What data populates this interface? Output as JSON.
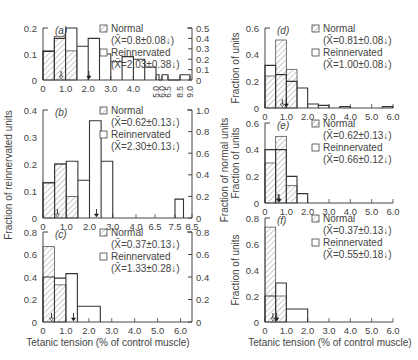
{
  "chart_data": [
    {
      "panel": "a",
      "type": "bar",
      "title": "(a)",
      "xlabel": "",
      "ylabel_left": "Fraction of reinnervated units",
      "ylabel_right": "Fraction of normal units",
      "x_ticks": [
        "0",
        "1.0",
        "2.0",
        "3.0",
        "4.0",
        "5.0",
        "6.0",
        "6.5",
        "8.5",
        "9.0"
      ],
      "y_left_ticks": [
        "0",
        "0.1",
        "0.2"
      ],
      "y_left_lim": [
        0,
        0.2
      ],
      "y_right_ticks": [
        "0",
        "0.1",
        "0.2",
        "0.3",
        "0.4",
        "0.5"
      ],
      "y_right_lim": [
        0,
        0.5
      ],
      "legend": [
        {
          "label": "Normal",
          "stat": "(X̄=0.8±0.08↓)",
          "style": "hatched"
        },
        {
          "label": "Reinnervated",
          "stat": "(X̄=2.03±0.38↓)",
          "style": "open"
        }
      ],
      "series": [
        {
          "name": "Normal (right axis)",
          "bins": [
            [
              0,
              0.5,
              0.28
            ],
            [
              0.5,
              1.0,
              0.42
            ],
            [
              1.0,
              1.5,
              0.28
            ]
          ]
        },
        {
          "name": "Reinnervated (left axis)",
          "bins": [
            [
              0,
              0.5,
              0.11
            ],
            [
              0.5,
              1.0,
              0.16
            ],
            [
              1.0,
              1.5,
              0.2
            ],
            [
              1.5,
              2.0,
              0.13
            ],
            [
              2.0,
              2.5,
              0.16
            ],
            [
              2.5,
              3.0,
              0.1
            ],
            [
              3.0,
              3.5,
              0.07
            ],
            [
              3.5,
              4.0,
              0.09
            ],
            [
              4.0,
              4.5,
              0.08
            ],
            [
              4.5,
              5.0,
              0.05
            ],
            [
              5.0,
              5.5,
              0.02
            ],
            [
              5.5,
              6.0,
              0.0
            ],
            [
              6.0,
              6.5,
              0.02
            ],
            [
              6.5,
              8.5,
              0.0
            ],
            [
              8.5,
              9.0,
              0.02
            ]
          ]
        }
      ],
      "mean_arrows": {
        "normal": 0.8,
        "reinnervated": 2.03
      }
    },
    {
      "panel": "b",
      "type": "bar",
      "title": "(b)",
      "x_ticks": [
        "0",
        "1.0",
        "2.0",
        "3.0",
        "4.0",
        "6.5",
        "7.5",
        "8.5"
      ],
      "y_left_ticks": [
        "0",
        "0.1",
        "0.2",
        "0.3",
        "0.4"
      ],
      "y_left_lim": [
        0,
        0.4
      ],
      "y_right_ticks": [
        "0",
        "0.2",
        "0.4",
        "0.6",
        "0.8",
        "1.0"
      ],
      "y_right_lim": [
        0,
        1.0
      ],
      "legend": [
        {
          "label": "Normal",
          "stat": "(X̄=0.62±0.13↓)",
          "style": "hatched"
        },
        {
          "label": "Reinnervated",
          "stat": "(X̄=2.30±0.13↓)",
          "style": "open"
        }
      ],
      "series": [
        {
          "name": "Normal (right axis)",
          "bins": [
            [
              0,
              0.5,
              0.33
            ],
            [
              0.5,
              1.0,
              0.5
            ],
            [
              1.0,
              1.5,
              0.2
            ]
          ]
        },
        {
          "name": "Reinnervated (left axis)",
          "bins": [
            [
              0,
              0.5,
              0.13
            ],
            [
              0.5,
              1.0,
              0.2
            ],
            [
              1.0,
              1.5,
              0.21
            ],
            [
              1.5,
              2.0,
              0.14
            ],
            [
              2.0,
              2.5,
              0.36
            ],
            [
              2.5,
              3.0,
              0.21
            ],
            [
              7.5,
              8.0,
              0.07
            ]
          ]
        }
      ],
      "mean_arrows": {
        "normal": 0.62,
        "reinnervated": 2.3
      }
    },
    {
      "panel": "c",
      "type": "bar",
      "title": "(c)",
      "xlabel": "Tetanic tension (% of control muscle)",
      "x_ticks": [
        "0",
        "1.0",
        "2.0",
        "3.0",
        "4.0",
        "5.0",
        "6.0"
      ],
      "y_left_ticks": [
        "0",
        "0.2",
        "0.4",
        "0.6",
        "0.8"
      ],
      "y_left_lim": [
        0,
        0.8
      ],
      "y_right_ticks": [
        "0",
        "0.2",
        "0.4",
        "0.6",
        "0.8"
      ],
      "y_right_lim": [
        0,
        0.8
      ],
      "legend": [
        {
          "label": "Normal",
          "stat": "(X̄=0.37±0.13↓)",
          "style": "hatched"
        },
        {
          "label": "Reinnervated",
          "stat": "(X̄=1.33±0.28↓)",
          "style": "open"
        }
      ],
      "series": [
        {
          "name": "Normal",
          "bins": [
            [
              0,
              0.5,
              0.67
            ],
            [
              0.5,
              1.0,
              0.33
            ]
          ]
        },
        {
          "name": "Reinnervated",
          "bins": [
            [
              0,
              0.5,
              0.4
            ],
            [
              0.5,
              1.0,
              0.39
            ],
            [
              1.0,
              1.5,
              0.43
            ],
            [
              1.5,
              2.5,
              0.14
            ]
          ]
        }
      ],
      "mean_arrows": {
        "normal": 0.37,
        "reinnervated": 1.33
      }
    },
    {
      "panel": "d",
      "type": "bar",
      "title": "(d)",
      "ylabel": "Fraction of units",
      "x_ticks": [
        "0",
        "1.0",
        "2.0",
        "3.0",
        "4.0",
        "5.0",
        "6.0"
      ],
      "y_ticks": [
        "0",
        "0.2",
        "0.4",
        "0.6"
      ],
      "ylim": [
        0,
        0.6
      ],
      "legend": [
        {
          "label": "Normal",
          "stat": "(X̄=0.81±0.08↓)",
          "style": "hatched"
        },
        {
          "label": "Reinnervated",
          "stat": "(X̄=1.00±0.08↓)",
          "style": "open"
        }
      ],
      "series": [
        {
          "name": "Normal",
          "bins": [
            [
              0,
              0.5,
              0.24
            ],
            [
              0.5,
              1.0,
              0.51
            ],
            [
              1.0,
              1.5,
              0.29
            ]
          ]
        },
        {
          "name": "Reinnervated",
          "bins": [
            [
              0,
              0.5,
              0.32
            ],
            [
              0.5,
              1.0,
              0.25
            ],
            [
              1.0,
              1.5,
              0.2
            ],
            [
              1.5,
              2.0,
              0.15
            ],
            [
              2.0,
              2.5,
              0.03
            ],
            [
              2.5,
              3.0,
              0.02
            ],
            [
              3.5,
              4.0,
              0.01
            ],
            [
              5.5,
              6.0,
              0.01
            ]
          ]
        }
      ],
      "mean_arrows": {
        "normal": 0.81,
        "reinnervated": 1.0
      }
    },
    {
      "panel": "e",
      "type": "bar",
      "title": "(e)",
      "ylabel": "Fraction of units",
      "x_ticks": [
        "0",
        "1.0",
        "2.0",
        "3.0",
        "4.0",
        "5.0",
        "6.0"
      ],
      "y_ticks": [
        "0",
        "0.2",
        "0.4",
        "0.6"
      ],
      "ylim": [
        0,
        0.6
      ],
      "legend": [
        {
          "label": "Normal",
          "stat": "(X̄=0.62±0.13↓)",
          "style": "hatched"
        },
        {
          "label": "Reinnervated",
          "stat": "(X̄=0.66±0.12↓)",
          "style": "open"
        }
      ],
      "series": [
        {
          "name": "Normal",
          "bins": [
            [
              0,
              0.5,
              0.3
            ],
            [
              0.5,
              1.0,
              0.5
            ],
            [
              1.0,
              1.5,
              0.13
            ]
          ]
        },
        {
          "name": "Reinnervated",
          "bins": [
            [
              0,
              0.5,
              0.4
            ],
            [
              0.5,
              1.0,
              0.4
            ],
            [
              1.0,
              1.5,
              0.2
            ],
            [
              1.5,
              2.0,
              0.07
            ]
          ]
        }
      ],
      "mean_arrows": {
        "normal": 0.62,
        "reinnervated": 0.66
      }
    },
    {
      "panel": "f",
      "type": "bar",
      "title": "(f)",
      "ylabel": "Fraction of units",
      "xlabel": "Tetanic tension (% of control muscle)",
      "x_ticks": [
        "0",
        "1.0",
        "2.0",
        "3.0",
        "4.0",
        "5.0",
        "6.0"
      ],
      "y_ticks": [
        "0",
        "0.2",
        "0.4",
        "0.6",
        "0.8"
      ],
      "ylim": [
        0,
        0.8
      ],
      "legend": [
        {
          "label": "Normal",
          "stat": "(X̄=0.37±0.13↓)",
          "style": "hatched"
        },
        {
          "label": "Reinnervated",
          "stat": "(X̄=0.55±0.18↓)",
          "style": "open"
        }
      ],
      "series": [
        {
          "name": "Normal",
          "bins": [
            [
              0,
              0.5,
              0.73
            ],
            [
              0.5,
              1.0,
              0.2
            ]
          ]
        },
        {
          "name": "Reinnervated",
          "bins": [
            [
              0,
              0.5,
              0.2
            ],
            [
              0.5,
              1.0,
              0.3
            ],
            [
              1.0,
              2.0,
              0.1
            ]
          ]
        }
      ],
      "mean_arrows": {
        "normal": 0.37,
        "reinnervated": 0.55
      }
    }
  ],
  "labels": {
    "left_ylabel": "Fraction of reinnervated units",
    "right_ylabel": "Fraction of normal units",
    "units_ylabel": "Fraction of units",
    "xlabel": "Tetanic tension (% of control muscle)"
  }
}
